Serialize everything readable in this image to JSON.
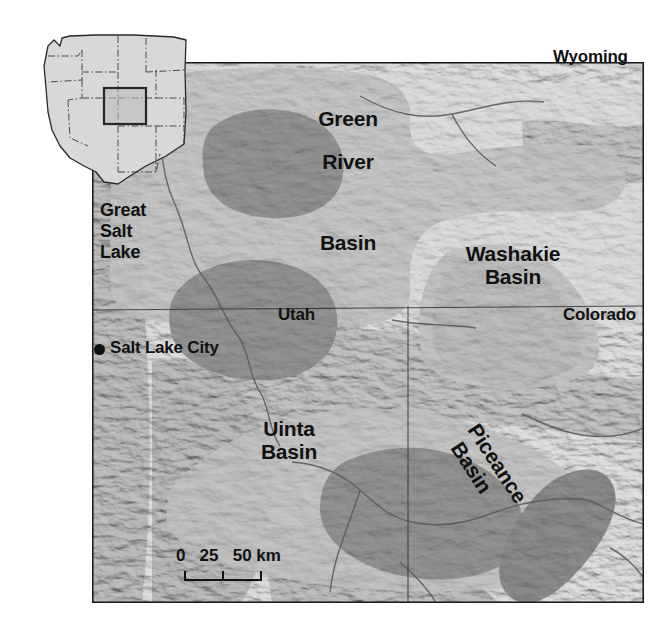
{
  "figure": {
    "kind": "shaded-relief locator map",
    "region": "Green River, Uinta, Washakie and Piceance basins",
    "background_color": "#ffffff"
  },
  "inset": {
    "name": "western-united-states-inset",
    "land_color": "#d8d8d8",
    "outline_color": "#2a2a2a",
    "locator_box_color": "#262626",
    "locator_box_fill": "#b9b9b9"
  },
  "main_map": {
    "frame_color": "#1a1a1a",
    "relief_light": "#e9e9e9",
    "relief_mid": "#cfcfcf",
    "relief_dark": "#9a9a9a",
    "basin_light_color": "#c4c4c4",
    "basin_dark_color": "#999999",
    "river_color": "#5a5a5a",
    "state_line_color": "#3a3a3a"
  },
  "state_labels": [
    {
      "name": "wyoming",
      "text": "Wyoming"
    },
    {
      "name": "utah",
      "text": "Utah"
    },
    {
      "name": "colorado",
      "text": "Colorado"
    }
  ],
  "basin_labels": [
    {
      "name": "green-river-basin",
      "line1": "Green",
      "line2": "River",
      "line3": "Basin"
    },
    {
      "name": "washakie-basin",
      "line1": "Washakie",
      "line2": "Basin"
    },
    {
      "name": "uinta-basin",
      "line1": "Uinta",
      "line2": "Basin"
    },
    {
      "name": "piceance-basin",
      "line1": "Piceance",
      "line2": "Basin",
      "rotation_deg": 57
    }
  ],
  "place_labels": [
    {
      "name": "great-salt-lake",
      "line1": "Great",
      "line2": "Salt",
      "line3": "Lake"
    },
    {
      "name": "salt-lake-city",
      "text": "Salt Lake City",
      "marker": "filled-circle"
    }
  ],
  "scale_bar": {
    "name": "scale-bar",
    "numbers": "0   25   50 km",
    "ticks": [
      "0",
      "25",
      "50"
    ],
    "units": "km",
    "max_value": 50
  }
}
